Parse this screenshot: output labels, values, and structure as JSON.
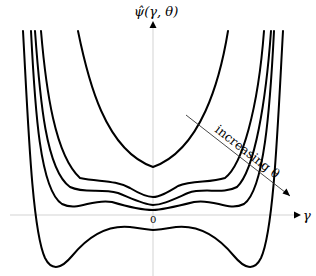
{
  "figure": {
    "y_axis_label": "ψ̂(γ, θ)",
    "x_axis_label": "γ",
    "origin_label": "0",
    "annotation": "increasing θ",
    "colors": {
      "curve": "#000000",
      "axis": "#c8c8c8"
    }
  },
  "curves": [
    {
      "name": "theta-1",
      "description": "single-well parabola, highest",
      "center_min_y": 167
    },
    {
      "name": "theta-2",
      "description": "wavy, shallow double-well",
      "center_min_y": 197
    },
    {
      "name": "theta-3",
      "description": "wavy, shallow double-well",
      "center_min_y": 205
    },
    {
      "name": "theta-4",
      "description": "wavy, double-well near axis",
      "center_min_y": 210
    },
    {
      "name": "theta-5",
      "description": "deep double-well below axis",
      "center_min_y": 229
    }
  ]
}
